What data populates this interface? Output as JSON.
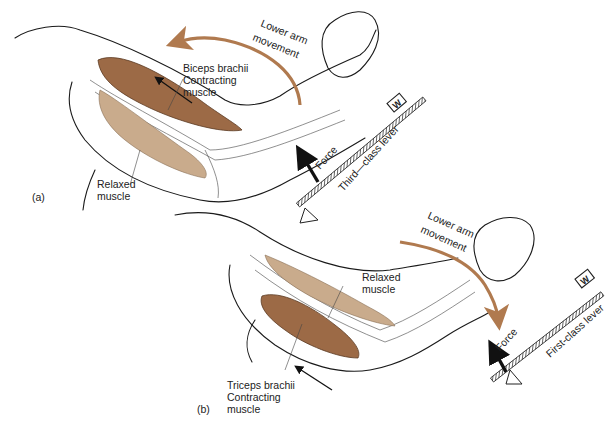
{
  "figure": {
    "panels": [
      {
        "id": "a",
        "label": "(a)",
        "movement_label": [
          "Lower arm",
          "movement"
        ],
        "movement_direction": "upward (flexion)",
        "contracting_muscle_label": [
          "Biceps brachii",
          "Contracting",
          "muscle"
        ],
        "relaxed_muscle_label": [
          "Relaxed",
          "muscle"
        ],
        "force_label": "Force",
        "weight_label": "W",
        "lever_label": "Third—class lever"
      },
      {
        "id": "b",
        "label": "(b)",
        "movement_label": [
          "Lower arm",
          "movement"
        ],
        "movement_direction": "downward (extension)",
        "contracting_muscle_label": [
          "Triceps brachii",
          "Contracting",
          "muscle"
        ],
        "relaxed_muscle_label": [
          "Relaxed",
          "muscle"
        ],
        "force_label": "Force",
        "weight_label": "W",
        "lever_label": "First-class lever"
      }
    ],
    "colors": {
      "contracting_muscle": "#9c6a46",
      "relaxed_muscle": "#c9ab8c",
      "movement_arrow": "#b07a4f",
      "outline": "#1a1a1a"
    }
  }
}
